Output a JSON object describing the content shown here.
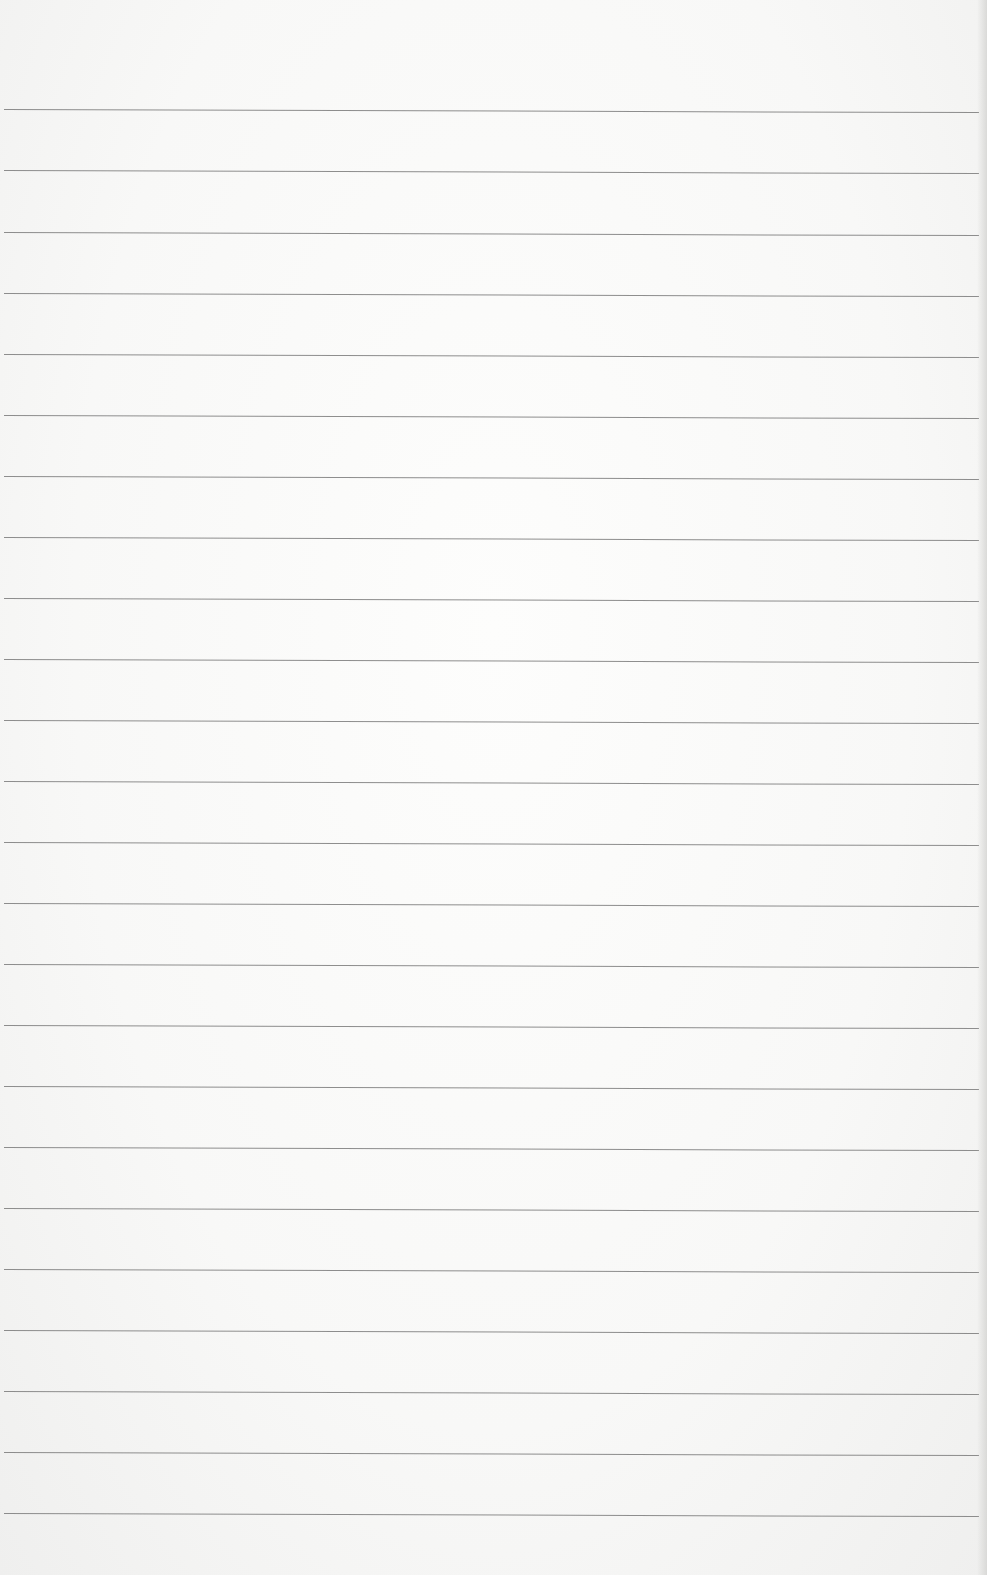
{
  "paper": {
    "type": "lined paper",
    "background_color": "#f7f7f6",
    "line_color": "#7a7a7a",
    "line_count": 24,
    "line_positions_y": [
      109,
      170,
      232,
      293,
      354,
      415,
      476,
      537,
      598,
      659,
      720,
      781,
      842,
      903,
      964,
      1025,
      1086,
      1147,
      1208,
      1269,
      1330,
      1391,
      1452,
      1513
    ]
  }
}
